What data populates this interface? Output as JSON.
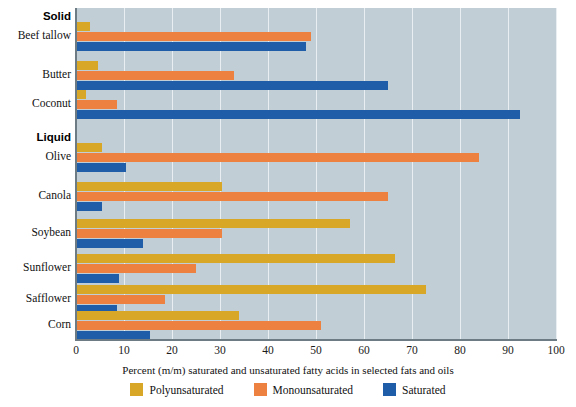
{
  "chart_data": {
    "type": "bar",
    "orientation": "horizontal",
    "title": "",
    "xlabel": "Percent (m/m) saturated and unsaturated fatty acids in selected fats and oils",
    "ylabel": "",
    "xlim": [
      0,
      100
    ],
    "xticks": [
      0,
      10,
      20,
      30,
      40,
      50,
      60,
      70,
      80,
      90,
      100
    ],
    "grid": true,
    "legend_position": "bottom",
    "categories": [
      "Beef tallow",
      "Butter",
      "Coconut",
      "Olive",
      "Canola",
      "Soybean",
      "Sunflower",
      "Safflower",
      "Corn"
    ],
    "group_labels": [
      "Solid",
      "Liquid"
    ],
    "groups": [
      {
        "label": "Solid",
        "categories": [
          "Beef tallow",
          "Butter",
          "Coconut"
        ]
      },
      {
        "label": "Liquid",
        "categories": [
          "Olive",
          "Canola",
          "Soybean",
          "Sunflower",
          "Safflower",
          "Corn"
        ]
      }
    ],
    "series": [
      {
        "name": "Polyunsaturated",
        "color": "#d9a727",
        "values": [
          3,
          4.5,
          2,
          5.5,
          30.5,
          57,
          66.5,
          73,
          34
        ]
      },
      {
        "name": "Monounsaturated",
        "color": "#ed8140",
        "values": [
          49,
          33,
          8.5,
          84,
          65,
          30.5,
          25,
          18.5,
          51
        ]
      },
      {
        "name": "Saturated",
        "color": "#1f5da8",
        "values": [
          48,
          65,
          92.5,
          10.5,
          5.5,
          14,
          9,
          8.5,
          15.5
        ]
      }
    ]
  },
  "legend": {
    "items": [
      {
        "label": "Polyunsaturated",
        "color": "#d9a727"
      },
      {
        "label": "Monounsaturated",
        "color": "#ed8140"
      },
      {
        "label": "Saturated",
        "color": "#1f5da8"
      }
    ]
  },
  "colors": {
    "plot_background": "#c2ced6",
    "gridline": "#e8eef1",
    "axis": "#6d7b85",
    "polyunsaturated": "#d9a727",
    "monounsaturated": "#ed8140",
    "saturated": "#1f5da8"
  }
}
